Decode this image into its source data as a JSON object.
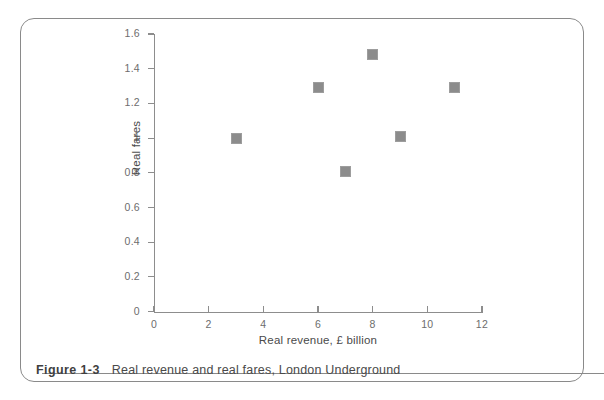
{
  "figure": {
    "number_label": "Figure 1-3",
    "caption": "Real revenue and real fares, London Underground"
  },
  "chart_data": {
    "type": "scatter",
    "title": "",
    "xlabel": "Real revenue, £ billion",
    "ylabel": "Real fares",
    "xlim": [
      0,
      12
    ],
    "ylim": [
      0,
      1.6
    ],
    "xticks": [
      0,
      2,
      4,
      6,
      8,
      10,
      12
    ],
    "xtick_labels": [
      "0",
      "2",
      "4",
      "6",
      "8",
      "10",
      "12"
    ],
    "yticks": [
      0,
      0.2,
      0.4,
      0.6,
      0.8,
      1,
      1.2,
      1.4,
      1.6
    ],
    "ytick_labels": [
      "0",
      "0.2",
      "0.4",
      "0.6",
      "0.8",
      "1",
      "1.2",
      "1.4",
      "1.6"
    ],
    "grid": false,
    "legend": false,
    "marker": "square",
    "marker_color": "#8c8c8c",
    "axis_color": "#8d8d8d",
    "points": [
      {
        "x": 3,
        "y": 1.0
      },
      {
        "x": 6,
        "y": 1.29
      },
      {
        "x": 7,
        "y": 0.81
      },
      {
        "x": 8,
        "y": 1.48
      },
      {
        "x": 9,
        "y": 1.01
      },
      {
        "x": 11,
        "y": 1.29
      }
    ]
  },
  "colors": {
    "frame": "#8a8a8a",
    "text": "#4a4a4a",
    "tick_text": "#6d6d6d",
    "marker": "#8c8c8c"
  }
}
